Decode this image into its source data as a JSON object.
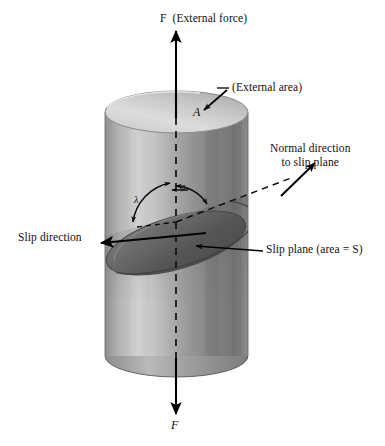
{
  "figure": {
    "background_color": "#ffffff",
    "ink_color": "#000000"
  },
  "labels": {
    "force_top": {
      "symbol": "F",
      "text": "(External force)",
      "full": "F  (External force)"
    },
    "external_area": {
      "text": "(External area)"
    },
    "area_symbol": {
      "symbol": "A"
    },
    "normal_direction": {
      "line1": "Normal direction",
      "line2": "to slip plane"
    },
    "slip_direction": {
      "text": "Slip direction"
    },
    "slip_plane": {
      "prefix": "Slip plane (area = ",
      "symbol": "S",
      "suffix": ")",
      "full": "Slip plane (area = S)"
    },
    "force_bottom": {
      "symbol": "F"
    }
  },
  "angles": {
    "phi": {
      "symbol": "φ",
      "meaning": "angle between tensile axis and normal to slip plane"
    },
    "lambda": {
      "symbol": "λ",
      "meaning": "angle between tensile axis and slip direction"
    }
  },
  "geometry": {
    "cylinder": {
      "left_x": 105,
      "right_x": 248,
      "top_y": 112,
      "bottom_y": 356,
      "ellipse_ry": 21
    },
    "axis_x": 176,
    "slip_plane_tilt_degrees": 28
  },
  "colors": {
    "cylinder_top_light": "#d9d9d9",
    "cylinder_top_dark": "#a8a8a8",
    "cylinder_body_light": "#cfcfcf",
    "cylinder_body_mid": "#9a9a9a",
    "cylinder_body_dark": "#6d6d6d",
    "slip_plane_fill": "#5f5f5f",
    "slip_plane_edge": "#4a4a4a",
    "outline": "#3a3a3a",
    "arrow": "#000000"
  }
}
